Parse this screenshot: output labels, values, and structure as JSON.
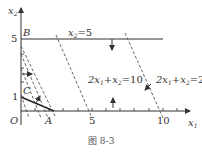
{
  "figure": {
    "caption": "图 8-3",
    "axes": {
      "x_label": "x",
      "x_label_sub": "1",
      "y_label": "x",
      "y_label_sub": "2",
      "origin_label": "O",
      "x_ticks": [
        "5",
        "10"
      ],
      "y_ticks": [
        "1",
        "5"
      ]
    },
    "points": {
      "A": "A",
      "B": "B",
      "C": "C"
    },
    "lines": {
      "x2_eq_5": {
        "lhs": "x",
        "sub": "2",
        "rhs": "=5"
      },
      "eq10": {
        "a": "2x",
        "a_sub": "1",
        "b": "+x",
        "b_sub": "2",
        "rhs": "=10"
      },
      "eq20": {
        "a": "2x",
        "a_sub": "1",
        "b": "+x",
        "b_sub": "2",
        "rhs": "=20"
      }
    },
    "colors": {
      "axis": "#333333",
      "solid_line": "#333333",
      "dashed_line": "#555555"
    }
  }
}
